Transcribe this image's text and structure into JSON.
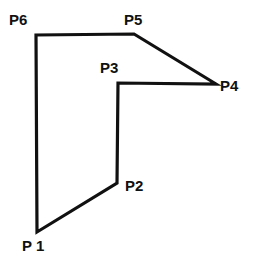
{
  "figure": {
    "name": "labeled-hexagon-polygon",
    "background_color": "#ffffff",
    "stroke_color": "#111111",
    "stroke_width": 3.2,
    "canvas": {
      "width": 253,
      "height": 262
    },
    "closed": true
  },
  "labels": {
    "p1": "P 1",
    "p2": "P2",
    "p3": "P3",
    "p4": "P4",
    "p5": "P5",
    "p6": "P6"
  },
  "chart_data": {
    "type": "scatter",
    "title": "",
    "xlabel": "",
    "ylabel": "",
    "xlim": [
      0,
      253
    ],
    "ylim": [
      0,
      262
    ],
    "grid": false,
    "legend": "none",
    "series": [
      {
        "name": "polygon-outline",
        "closed": true,
        "points": [
          {
            "label": "P1",
            "x": 37,
            "y": 232
          },
          {
            "label": "P2",
            "x": 117,
            "y": 183
          },
          {
            "label": "P3",
            "x": 118,
            "y": 83
          },
          {
            "label": "P4",
            "x": 216,
            "y": 84
          },
          {
            "label": "P5",
            "x": 134,
            "y": 34
          },
          {
            "label": "P6",
            "x": 36,
            "y": 35
          }
        ]
      }
    ],
    "label_positions": [
      {
        "label": "P 1",
        "x": 22,
        "y": 238
      },
      {
        "label": "P2",
        "x": 125,
        "y": 178
      },
      {
        "label": "P3",
        "x": 100,
        "y": 60
      },
      {
        "label": "P4",
        "x": 220,
        "y": 78
      },
      {
        "label": "P5",
        "x": 124,
        "y": 12
      },
      {
        "label": "P6",
        "x": 9,
        "y": 12
      }
    ]
  }
}
